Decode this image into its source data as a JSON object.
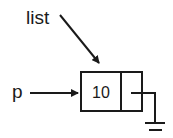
{
  "diagram": {
    "type": "linked-list-node",
    "pointers": [
      {
        "name": "list",
        "target": "node"
      },
      {
        "name": "p",
        "target": "node"
      }
    ],
    "node": {
      "data": "10",
      "next": "null"
    }
  },
  "labels": {
    "list": "list",
    "p": "p",
    "node_value": "10"
  },
  "icons": {
    "null_pointer": "ground-icon"
  },
  "colors": {
    "stroke": "#1a1a1a",
    "background": "#ffffff"
  }
}
